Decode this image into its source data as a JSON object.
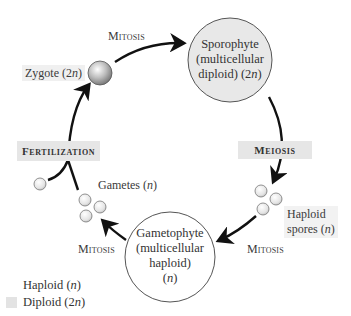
{
  "diagram": {
    "type": "life-cycle",
    "nodes": {
      "zygote": {
        "label": "Zygote (2n)",
        "label_main": "Zygote (2",
        "label_n": "n",
        "label_end": ")"
      },
      "sporophyte": {
        "line1": "Sporophyte",
        "line2": "(multicellular",
        "line3_main": "diploid) (2",
        "line3_n": "n",
        "line3_end": ")"
      },
      "spores": {
        "line1": "Haploid",
        "line2_main": "spores (",
        "line2_n": "n",
        "line2_end": ")"
      },
      "gametophyte": {
        "line1": "Gametophyte",
        "line2": "(multicellular",
        "line3": "haploid)",
        "line4_main": "(",
        "line4_n": "n",
        "line4_end": ")"
      },
      "gametes": {
        "label_main": "Gametes (",
        "label_n": "n",
        "label_end": ")"
      }
    },
    "processes": {
      "mitosis_top": "Mitosis",
      "meiosis": "Meiosis",
      "mitosis_right": "Mitosis",
      "mitosis_left": "Mitosis",
      "fertilization": "Fertilization"
    },
    "edges": [
      {
        "from": "zygote",
        "to": "sporophyte",
        "via": "Mitosis"
      },
      {
        "from": "sporophyte",
        "to": "spores",
        "via": "Meiosis"
      },
      {
        "from": "spores",
        "to": "gametophyte",
        "via": "Mitosis"
      },
      {
        "from": "gametophyte",
        "to": "gametes",
        "via": "Mitosis"
      },
      {
        "from": "gametes",
        "to": "zygote",
        "via": "Fertilization"
      }
    ],
    "legend": [
      {
        "label_main": "Haploid (",
        "label_n": "n",
        "label_end": ")",
        "color": "#ffffff"
      },
      {
        "label_main": "Diploid (2",
        "label_n": "n",
        "label_end": ")",
        "color": "#e3e3e3"
      }
    ],
    "colors": {
      "diploid_fill": "#e8e8e8",
      "haploid_fill": "#ffffff",
      "process_box": "#e6e6e6",
      "arrow": "#111111"
    }
  }
}
